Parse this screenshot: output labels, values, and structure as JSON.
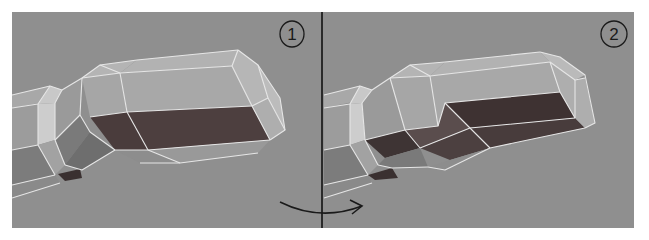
{
  "figure": {
    "background": "#ffffff",
    "viewport_color": "#8f8f8f",
    "wire_color": "#e6e6e6",
    "ink_color": "#1a1a1a",
    "divider": {
      "x": 322,
      "y1": 12,
      "y2": 228
    },
    "panels": [
      {
        "id": "panel-1",
        "label": "1",
        "label_pos": {
          "cx": 292,
          "cy": 34,
          "rx": 12,
          "ry": 13
        },
        "rect": {
          "x": 12,
          "y": 12,
          "w": 310,
          "h": 216
        },
        "faces": [
          {
            "pts": "12,95 50,86 55,100 12,108",
            "fill": "#a8a8a8"
          },
          {
            "pts": "12,108 38,104 38,145 12,150",
            "fill": "#9c9c9c"
          },
          {
            "pts": "12,150 38,145 55,175 12,185",
            "fill": "#7c7c7c"
          },
          {
            "pts": "12,185 55,175 60,183 12,198",
            "fill": "#8a8a8a"
          },
          {
            "pts": "38,104 50,86 62,90 55,103",
            "fill": "#c8c8c8"
          },
          {
            "pts": "38,104 55,103 55,140 38,145",
            "fill": "#cdcdcd"
          },
          {
            "pts": "38,145 55,140 65,165 55,175",
            "fill": "#a2a2a2"
          },
          {
            "pts": "55,103 62,90 82,78 80,115 55,140",
            "fill": "#9a9a9a"
          },
          {
            "pts": "55,140 80,115 90,132 65,165",
            "fill": "#7a7a7a"
          },
          {
            "pts": "65,165 90,132 115,150 82,170",
            "fill": "#6e6e6e"
          },
          {
            "pts": "58,174 80,169 82,178 65,181",
            "fill": "#3a3030"
          },
          {
            "pts": "82,78 100,65 137,60 120,73",
            "fill": "#b4b4b4"
          },
          {
            "pts": "120,73 137,60 238,50 232,66",
            "fill": "#b2b2b2"
          },
          {
            "pts": "82,78 120,73 127,112 90,117",
            "fill": "#a6a6a6"
          },
          {
            "pts": "120,73 232,66 252,106 127,112",
            "fill": "#a8a8a8"
          },
          {
            "pts": "90,117 127,112 148,150 115,150",
            "fill": "#4a3c3c"
          },
          {
            "pts": "127,112 252,106 270,140 148,150",
            "fill": "#4d3f3f"
          },
          {
            "pts": "115,150 148,150 180,163 140,163",
            "fill": "#8d8d8d"
          },
          {
            "pts": "148,150 270,140 258,153 180,163",
            "fill": "#999999"
          },
          {
            "pts": "238,50 258,65 268,98 252,106 232,66",
            "fill": "#b6b6b6"
          },
          {
            "pts": "252,106 268,98 285,130 270,140",
            "fill": "#aeaeae"
          },
          {
            "pts": "258,65 280,98 285,130 268,98",
            "fill": "#bcbcbc"
          }
        ],
        "edges": [
          "12,95 50,86",
          "12,108 38,104",
          "12,150 38,145",
          "12,185 55,175",
          "12,198 60,183",
          "38,104 38,145",
          "55,103 55,140",
          "38,104 50,86 62,90 55,103",
          "38,145 55,175",
          "55,140 65,165",
          "62,90 82,78",
          "82,78 80,115",
          "55,140 80,115",
          "80,115 90,132",
          "90,132 115,150",
          "65,165 82,170 115,150",
          "82,78 100,65 137,60",
          "100,65 120,73",
          "137,60 238,50",
          "120,73 232,66",
          "82,78 120,73",
          "120,73 127,112",
          "90,117 127,112 252,106",
          "127,112 148,150",
          "115,150 148,150 270,140",
          "140,163 180,163 258,153",
          "148,150 180,163",
          "238,50 258,65 280,98 285,130 270,140",
          "232,66 252,106",
          "232,66 238,50",
          "252,106 268,98 258,65",
          "268,98 285,130",
          "252,106 270,140"
        ],
        "arrow": null
      },
      {
        "id": "panel-2",
        "label": "2",
        "label_pos": {
          "cx": 614,
          "cy": 34,
          "rx": 13,
          "ry": 13
        },
        "rect": {
          "x": 322,
          "y": 12,
          "w": 312,
          "h": 216
        },
        "faces": [
          {
            "pts": "324,95 360,86 362,100 324,108",
            "fill": "#a8a8a8"
          },
          {
            "pts": "324,108 350,104 350,145 324,150",
            "fill": "#9c9c9c"
          },
          {
            "pts": "324,150 350,145 368,175 324,185",
            "fill": "#7c7c7c"
          },
          {
            "pts": "324,185 368,175 372,183 324,198",
            "fill": "#8a8a8a"
          },
          {
            "pts": "350,104 360,86 372,90 362,103",
            "fill": "#c8c8c8"
          },
          {
            "pts": "350,104 362,103 365,140 350,145",
            "fill": "#cdcdcd"
          },
          {
            "pts": "350,145 365,140 378,165 368,175",
            "fill": "#a2a2a2"
          },
          {
            "pts": "362,103 372,90 390,78 405,130 365,140",
            "fill": "#9a9a9a"
          },
          {
            "pts": "365,140 405,130 420,148 385,158",
            "fill": "#3e3434"
          },
          {
            "pts": "378,165 385,158 420,148 428,167 392,168",
            "fill": "#7a7a7a"
          },
          {
            "pts": "368,175 392,168 398,178 375,180",
            "fill": "#3a3030"
          },
          {
            "pts": "390,78 410,65 445,62 430,76",
            "fill": "#b4b4b4"
          },
          {
            "pts": "430,76 445,62 540,52 550,62",
            "fill": "#b2b2b2"
          },
          {
            "pts": "390,78 430,76 438,126 405,130",
            "fill": "#a6a6a6"
          },
          {
            "pts": "430,76 550,62 560,92 445,103 438,126",
            "fill": "#a8a8a8"
          },
          {
            "pts": "405,130 438,126 445,103 470,128 420,148",
            "fill": "#5a4d4d"
          },
          {
            "pts": "445,103 560,92 575,118 470,128",
            "fill": "#3e3232"
          },
          {
            "pts": "420,148 470,128 490,148 450,160",
            "fill": "#4c4040"
          },
          {
            "pts": "470,128 575,118 585,128 490,148",
            "fill": "#483c3c"
          },
          {
            "pts": "428,167 450,160 490,148 445,170",
            "fill": "#8d8d8d"
          },
          {
            "pts": "540,52 560,57 585,75 575,80 550,62",
            "fill": "#bababa"
          },
          {
            "pts": "550,62 575,80 585,78 595,123 585,128 575,118 560,92",
            "fill": "#aeaeae"
          }
        ],
        "edges": [
          "324,95 360,86",
          "324,108 350,104",
          "324,150 350,145",
          "324,185 368,175",
          "324,198 372,183",
          "350,104 350,145",
          "362,103 365,140",
          "350,104 360,86 372,90 362,103",
          "350,145 368,175",
          "365,140 378,165",
          "372,90 390,78",
          "390,78 405,130",
          "365,140 405,130",
          "405,130 420,148",
          "378,165 392,168 428,167",
          "390,78 410,65 445,62",
          "410,65 430,76",
          "445,62 540,52",
          "430,76 550,62",
          "390,78 430,76",
          "430,76 438,126",
          "405,130 438,126 445,103 560,92",
          "445,103 470,128",
          "420,148 470,128 575,118",
          "470,128 490,148",
          "428,167 445,170 490,148 585,128",
          "540,52 560,57 585,75 595,123 585,128",
          "550,62 560,92",
          "550,62 575,80 585,78",
          "575,80 575,118",
          "560,92 575,118"
        ],
        "arrow": {
          "path": "M 280 202 Q 320 222 362 206",
          "head": "350,200 362,206 352,214"
        }
      }
    ]
  }
}
